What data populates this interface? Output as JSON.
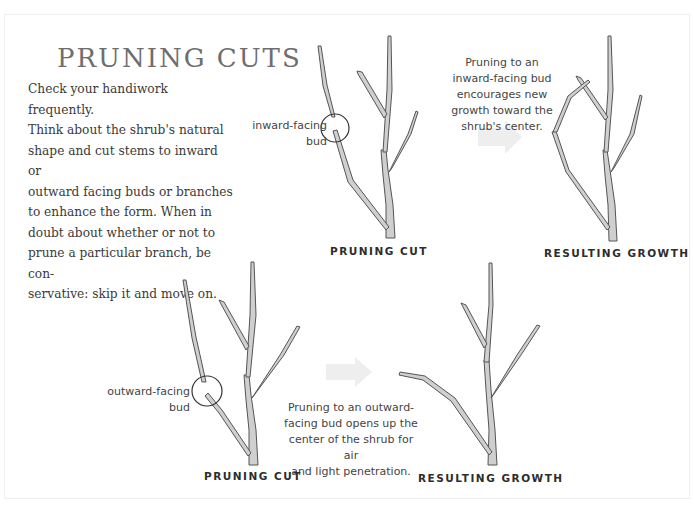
{
  "title": "PRUNING CUTS",
  "intro_lines": [
    "Check your handiwork frequently.",
    "Think about the shrub's natural",
    "shape and cut stems to inward or",
    "outward facing buds or branches",
    "to enhance the form. When in",
    "doubt about whether or not to",
    "prune a particular branch, be con-",
    "servative: skip it and move on."
  ],
  "top_row": {
    "bud_label_line1": "inward-facing",
    "bud_label_line2": "bud",
    "note_lines": [
      "Pruning to an",
      "inward-facing bud",
      "encourages new",
      "growth toward the",
      "shrub's center."
    ],
    "caption_left": "PRUNING CUT",
    "caption_right": "RESULTING GROWTH"
  },
  "bottom_row": {
    "bud_label_line1": "outward-facing",
    "bud_label_line2": "bud",
    "note_lines": [
      "Pruning to an outward-",
      "facing bud opens up the",
      "center of the shrub for air",
      "and light penetration."
    ],
    "caption_left": "PRUNING CUT",
    "caption_right": "RESULTING GROWTH"
  },
  "colors": {
    "title": "#6e6e6e",
    "body_text": "#3a3a3a",
    "arrow": "#eeeeee",
    "stem_fill": "#cfcfcf",
    "stem_outline": "#555555"
  }
}
